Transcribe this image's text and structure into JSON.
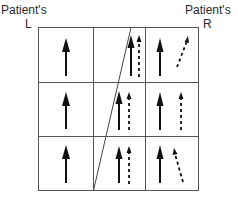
{
  "labels": {
    "left_title": "Patient's",
    "left_side": "L",
    "right_title": "Patient's",
    "right_side": "R"
  },
  "grid": {
    "rows": 3,
    "columns": 3,
    "line_color": "#555555"
  },
  "diagonal_line": {
    "description": "oblique line crossing middle column from top-right to bottom-left"
  },
  "cells": [
    [
      {
        "solid": "up"
      },
      {
        "solid": "up",
        "dashed": "up"
      },
      {
        "solid": "up",
        "dashed": "tilted-right"
      }
    ],
    [
      {
        "solid": "up"
      },
      {
        "solid": "up",
        "dashed": "up"
      },
      {
        "solid": "up",
        "dashed": "up"
      }
    ],
    [
      {
        "solid": "up"
      },
      {
        "solid": "up",
        "dashed": "up"
      },
      {
        "solid": "up",
        "dashed": "tilted-left"
      }
    ]
  ]
}
